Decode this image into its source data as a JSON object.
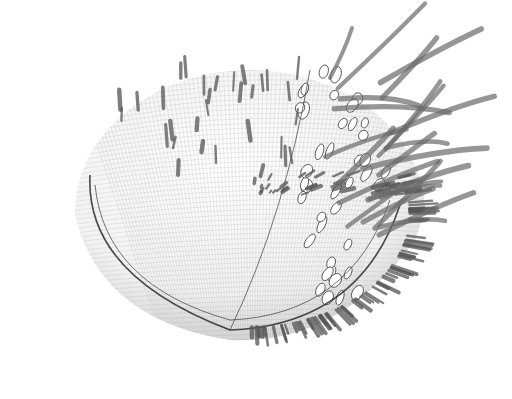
{
  "scene": {
    "description": "Grayscale wireframe 3D render of a hemispherical spiny microorganism with a perforated side band and long cilia",
    "background": "#ffffff",
    "body": {
      "cx": 250,
      "cy": 215,
      "rx": 175,
      "ry": 150,
      "mesh_color": "#9a9a9a"
    },
    "rim": {
      "color": "#2b2b2b"
    },
    "spine_color": "#555555",
    "cilia_color": "#6a6a6a",
    "pore_band": {
      "x_start": 300,
      "x_end": 390,
      "y_start": 70,
      "y_end": 300
    },
    "spine_count": 140,
    "cilia_count": 22,
    "pore_count": 40
  }
}
